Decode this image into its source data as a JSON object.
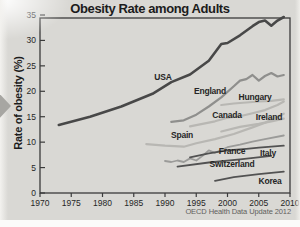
{
  "page": {
    "background": "#d9d8d4",
    "axis_color": "#3b3b3b",
    "nav_arrow_color": "#a7a6a2"
  },
  "chart_data": {
    "type": "line",
    "title": "Obesity Rate among Adults",
    "ylabel": "Rate of obesity (%)",
    "xlabel": "",
    "source": "OECD Health Data Update 2012",
    "xlim": [
      1970,
      2010
    ],
    "ylim": [
      0,
      35
    ],
    "x_ticks": [
      1970,
      1975,
      1980,
      1985,
      1990,
      1995,
      2000,
      2005,
      2010
    ],
    "y_ticks": [
      0,
      5,
      10,
      15,
      20,
      25,
      30,
      35
    ],
    "grid": false,
    "legend": "inline-labels-next-to-lines",
    "series": [
      {
        "id": "usa",
        "name": "USA",
        "color": "#484848",
        "width": 2.6,
        "label_at": [
          163,
          77
        ],
        "points": [
          [
            1973,
            13.4
          ],
          [
            1978,
            15.0
          ],
          [
            1983,
            17.0
          ],
          [
            1988,
            19.5
          ],
          [
            1991,
            21.8
          ],
          [
            1994,
            23.3
          ],
          [
            1997,
            26.0
          ],
          [
            1999,
            29.3
          ],
          [
            2000,
            29.5
          ],
          [
            2002,
            31.0
          ],
          [
            2004,
            32.8
          ],
          [
            2005,
            33.6
          ],
          [
            2006,
            33.9
          ],
          [
            2007,
            32.9
          ],
          [
            2008,
            33.9
          ],
          [
            2009,
            34.6
          ]
        ]
      },
      {
        "id": "england",
        "name": "England",
        "color": "#8f8f8d",
        "width": 2.2,
        "label_at": [
          210,
          91
        ],
        "points": [
          [
            1991,
            14.0
          ],
          [
            1993,
            14.3
          ],
          [
            1995,
            15.4
          ],
          [
            1997,
            17.0
          ],
          [
            1999,
            18.8
          ],
          [
            2001,
            21.0
          ],
          [
            2002,
            22.1
          ],
          [
            2003,
            22.4
          ],
          [
            2004,
            23.2
          ],
          [
            2005,
            22.1
          ],
          [
            2006,
            23.0
          ],
          [
            2007,
            23.6
          ],
          [
            2008,
            22.9
          ],
          [
            2009,
            23.2
          ]
        ]
      },
      {
        "id": "hungary",
        "name": "Hungary",
        "color": "#b8b7b3",
        "width": 2.2,
        "label_at": [
          255,
          97
        ],
        "points": [
          [
            1999,
            17.3
          ],
          [
            2001,
            17.6
          ],
          [
            2003,
            17.8
          ],
          [
            2005,
            18.0
          ],
          [
            2007,
            18.1
          ],
          [
            2009,
            18.4
          ]
        ]
      },
      {
        "id": "canada",
        "name": "Canada",
        "color": "#b8b7b3",
        "width": 2.2,
        "label_at": [
          227,
          115
        ],
        "points": [
          [
            1994,
            13.1
          ],
          [
            1996,
            13.6
          ],
          [
            1998,
            14.1
          ],
          [
            2000,
            14.8
          ],
          [
            2002,
            15.1
          ],
          [
            2004,
            15.7
          ],
          [
            2006,
            16.3
          ],
          [
            2008,
            17.3
          ],
          [
            2009,
            18.0
          ]
        ]
      },
      {
        "id": "ireland",
        "name": "Ireland",
        "color": "#b8b7b3",
        "width": 2.2,
        "label_at": [
          269,
          117
        ],
        "points": [
          [
            1999,
            12.1
          ],
          [
            2002,
            13.0
          ],
          [
            2005,
            13.6
          ],
          [
            2007,
            14.1
          ],
          [
            2009,
            14.6
          ]
        ]
      },
      {
        "id": "spain",
        "name": "Spain",
        "color": "#b8b7b3",
        "width": 2.2,
        "label_at": [
          182,
          135
        ],
        "points": [
          [
            1987,
            9.6
          ],
          [
            1990,
            9.3
          ],
          [
            1993,
            9.1
          ],
          [
            1995,
            9.8
          ],
          [
            1998,
            10.6
          ],
          [
            2001,
            11.6
          ],
          [
            2004,
            12.9
          ],
          [
            2006,
            13.8
          ],
          [
            2009,
            15.6
          ]
        ]
      },
      {
        "id": "france",
        "name": "France",
        "color": "#9b9b99",
        "width": 1.8,
        "label_at": [
          232,
          151
        ],
        "points": [
          [
            1990,
            6.3
          ],
          [
            1991,
            6.1
          ],
          [
            1992,
            6.4
          ],
          [
            1993,
            6.1
          ],
          [
            1994,
            6.8
          ],
          [
            1995,
            6.4
          ],
          [
            1996,
            7.3
          ],
          [
            1997,
            8.4
          ],
          [
            1998,
            7.9
          ],
          [
            2000,
            9.0
          ],
          [
            2002,
            9.5
          ],
          [
            2004,
            10.1
          ],
          [
            2006,
            10.6
          ],
          [
            2009,
            11.3
          ]
        ]
      },
      {
        "id": "italy",
        "name": "Italy",
        "color": "#525252",
        "width": 1.8,
        "label_at": [
          268,
          153
        ],
        "points": [
          [
            1994,
            7.0
          ],
          [
            1997,
            7.8
          ],
          [
            2000,
            8.4
          ],
          [
            2003,
            8.7
          ],
          [
            2005,
            8.9
          ],
          [
            2007,
            9.1
          ],
          [
            2009,
            9.3
          ]
        ]
      },
      {
        "id": "switzerland",
        "name": "Switzerland",
        "color": "#525252",
        "width": 1.8,
        "label_at": [
          232,
          164
        ],
        "points": [
          [
            1992,
            5.2
          ],
          [
            1997,
            6.0
          ],
          [
            2002,
            6.6
          ],
          [
            2007,
            7.3
          ]
        ]
      },
      {
        "id": "korea",
        "name": "Korea",
        "color": "#525252",
        "width": 1.8,
        "label_at": [
          270,
          181
        ],
        "points": [
          [
            1998,
            2.4
          ],
          [
            2001,
            3.1
          ],
          [
            2005,
            3.7
          ],
          [
            2009,
            4.2
          ]
        ]
      }
    ]
  }
}
